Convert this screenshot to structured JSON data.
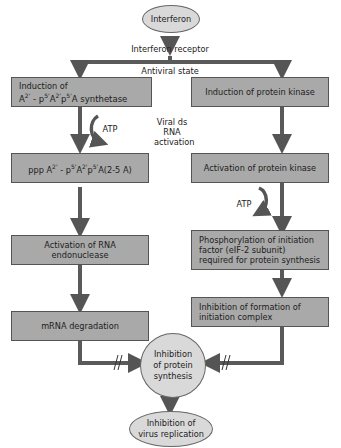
{
  "nodes": {
    "interferon": "Interferon",
    "receptor": "Interferon receptor",
    "antiviral_state": "Antiviral state",
    "left1_line1": "Induction of",
    "left1_line2_html": "A2' - p5'A2'p5'A synthetase",
    "left2": "ppp A2' - p5'A2'p5'A(2-5 A)",
    "left3": "Activation of RNA endonuclease",
    "left4": "mRNA degradation",
    "right1": "Induction of protein kinase",
    "right2": "Activation of protein kinase",
    "right3": "Phosphorylation of initiation factor (eIF-2 subunit) required for protein synthesis",
    "right4": "Inhibition of formation of initiation complex",
    "center": "Inhibition of protein synthesis",
    "final": "Inhibition of virus replication"
  },
  "labels": {
    "atp_left": "ATP",
    "atp_right": "ATP",
    "viral_activation": "Viral ds RNA activation"
  },
  "colors": {
    "box_fill": "#a9a9a9",
    "ellipse_fill": "#d9d9d9",
    "arrow": "#555555"
  }
}
